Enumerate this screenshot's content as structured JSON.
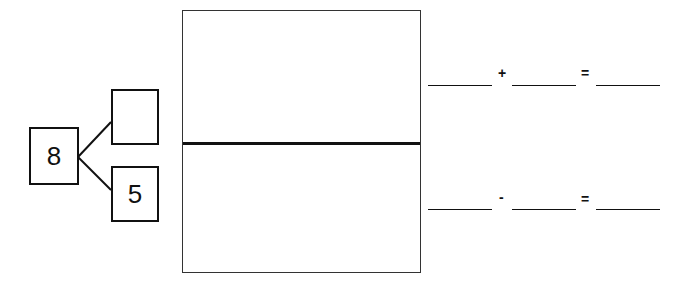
{
  "number_bond": {
    "whole": "8",
    "part_top": "",
    "part_bottom": "5"
  },
  "panel": {
    "top_section": "",
    "bottom_section": ""
  },
  "equations": [
    {
      "blank1": "",
      "operator": "+",
      "blank2": "",
      "equals": "=",
      "result": ""
    },
    {
      "blank1": "",
      "operator": "-",
      "blank2": "",
      "equals": "=",
      "result": ""
    }
  ]
}
